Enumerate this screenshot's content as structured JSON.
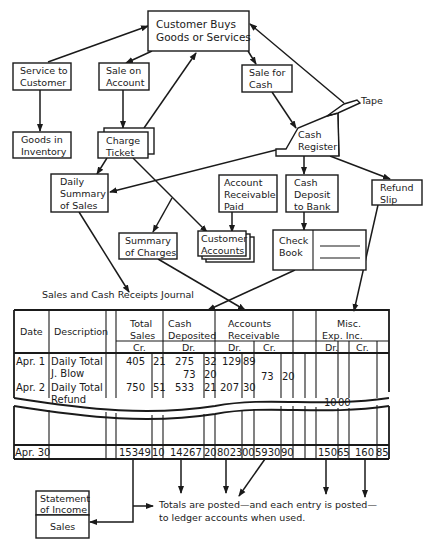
{
  "boxes": {
    "customer_buys": [
      "Customer Buys",
      "Goods or Services"
    ],
    "service_to_customer": [
      "Service to",
      "Customer"
    ],
    "sale_on_account": [
      "Sale on",
      "Account"
    ],
    "sale_for_cash": [
      "Sale for",
      "Cash"
    ],
    "tape": "Tape",
    "goods_in_inventory": [
      "Goods in",
      "Inventory"
    ],
    "charge_ticket": [
      "Charge",
      "Ticket"
    ],
    "cash_register": [
      "Cash",
      "Register"
    ],
    "daily_summary": [
      "Daily",
      "Summary",
      "of Sales"
    ],
    "account_receivable_paid": [
      "Account",
      "Receivable",
      "Paid"
    ],
    "cash_deposit": [
      "Cash",
      "Deposit",
      "to Bank"
    ],
    "refund_slip": [
      "Refund",
      "Slip"
    ],
    "summary_of_charges": [
      "Summary",
      "of Charges"
    ],
    "customer_accounts": [
      "Customer",
      "Accounts"
    ],
    "check_book": [
      "Check",
      "Book"
    ],
    "statement_of_income": [
      "Statement",
      "of Income"
    ],
    "sales": "Sales"
  },
  "journal": {
    "title": "Sales and Cash Receipts Journal",
    "headers": {
      "date": "Date",
      "description": "Description",
      "total_sales": [
        "Total",
        "Sales"
      ],
      "cash_deposited": [
        "Cash",
        "Deposited"
      ],
      "accounts_receivable": [
        "Accounts",
        "Receivable"
      ],
      "misc": [
        "Misc.",
        "Exp.   Inc."
      ]
    },
    "subheaders": {
      "total_sales": "Cr.",
      "cash_deposited": "Dr.",
      "ar_dr": "Dr.",
      "ar_cr": "Cr.",
      "misc_dr": "Dr.",
      "misc_cr": "Cr."
    },
    "rows": [
      {
        "date": "Apr. 1",
        "description": "Daily Total",
        "total_sales": "405",
        "total_sales_c": "21",
        "cash_dep": "275",
        "cash_dep_c": "32",
        "ar_dr": "129",
        "ar_dr_c": "89",
        "ar_cr": "",
        "ar_cr_c": "",
        "misc_dr": "",
        "misc_dr_c": "",
        "misc_cr": "",
        "misc_cr_c": ""
      },
      {
        "date": "",
        "description": "J. Blow",
        "total_sales": "",
        "total_sales_c": "",
        "cash_dep": "73",
        "cash_dep_c": "20",
        "ar_dr": "",
        "ar_dr_c": "",
        "ar_cr": "73",
        "ar_cr_c": "20",
        "misc_dr": "",
        "misc_dr_c": "",
        "misc_cr": "",
        "misc_cr_c": ""
      },
      {
        "date": "Apr. 2",
        "description": "Daily Total",
        "total_sales": "750",
        "total_sales_c": "51",
        "cash_dep": "533",
        "cash_dep_c": "21",
        "ar_dr": "207",
        "ar_dr_c": "30",
        "ar_cr": "",
        "ar_cr_c": "",
        "misc_dr": "",
        "misc_dr_c": "",
        "misc_cr": "",
        "misc_cr_c": ""
      },
      {
        "date": "",
        "description": "Refund",
        "total_sales": "",
        "total_sales_c": "",
        "cash_dep": "",
        "cash_dep_c": "",
        "ar_dr": "",
        "ar_dr_c": "",
        "ar_cr": "",
        "ar_cr_c": "",
        "misc_dr": "10",
        "misc_dr_c": "00",
        "misc_cr": "",
        "misc_cr_c": ""
      }
    ],
    "totals": {
      "date": "Apr. 30",
      "total_sales": "15349",
      "total_sales_c": "10",
      "cash_dep": "14267",
      "cash_dep_c": "20",
      "ar_dr": "8023",
      "ar_dr_c": "00",
      "ar_cr": "5930",
      "ar_cr_c": "90",
      "misc_dr": "150",
      "misc_dr_c": "65",
      "misc_cr": "160",
      "misc_cr_c": "85"
    }
  },
  "note": [
    "Totals are posted—and each entry is posted—",
    "to ledger accounts when used."
  ]
}
